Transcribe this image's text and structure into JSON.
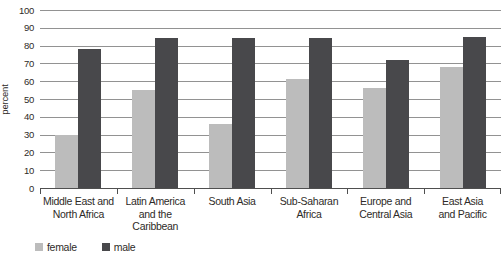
{
  "chart_data": {
    "type": "bar",
    "title": "",
    "xlabel": "",
    "ylabel": "percent",
    "ylim": [
      0,
      100
    ],
    "ytick_step": 10,
    "yticks": [
      0,
      10,
      20,
      30,
      40,
      50,
      60,
      70,
      80,
      90,
      100
    ],
    "grid": true,
    "legend_position": "bottom-left",
    "categories": [
      "Middle East and North Africa",
      "Latin America and the Caribbean",
      "South Asia",
      "Sub-Saharan Africa",
      "Europe and Central Asia",
      "East Asia and Pacific"
    ],
    "category_label_lines": [
      [
        "Middle East and",
        "North Africa"
      ],
      [
        "Latin America",
        "and the",
        "Caribbean"
      ],
      [
        "South Asia"
      ],
      [
        "Sub-Saharan",
        "Africa"
      ],
      [
        "Europe and",
        "Central Asia"
      ],
      [
        "East Asia",
        "and Pacific"
      ]
    ],
    "series": [
      {
        "name": "female",
        "color": "#bcbcbc",
        "values": [
          30,
          55,
          36,
          61,
          56,
          68
        ]
      },
      {
        "name": "male",
        "color": "#48484b",
        "values": [
          78,
          84,
          84,
          84,
          72,
          85
        ]
      }
    ]
  },
  "colors": {
    "background": "#ffffff",
    "gridline": "#929292",
    "axis": "#4f4f4f",
    "text": "#2e2b28"
  }
}
